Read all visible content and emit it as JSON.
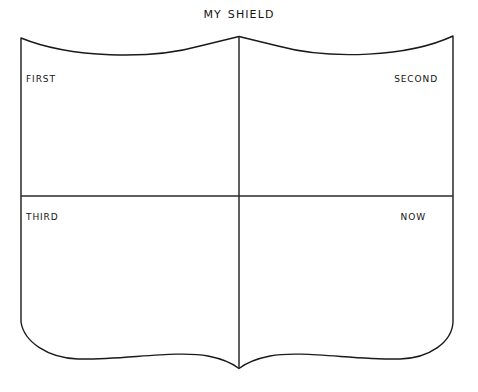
{
  "page": {
    "title": "My Shield",
    "background_color": "#ffffff",
    "ink_color": "#1a1a1a"
  },
  "heading": {
    "text": "My Shield"
  },
  "shield": {
    "outline_color": "#1a1a1a",
    "fill_color": "#ffffff",
    "divider_color": "#2a2a2a",
    "quadrants": [
      {
        "id": "first",
        "label": "First",
        "position": "top-left",
        "align": "left"
      },
      {
        "id": "second",
        "label": "Second",
        "position": "top-right",
        "align": "right"
      },
      {
        "id": "third",
        "label": "Third",
        "position": "bottom-left",
        "align": "left"
      },
      {
        "id": "now",
        "label": "Now",
        "position": "bottom-right",
        "align": "right"
      }
    ]
  }
}
